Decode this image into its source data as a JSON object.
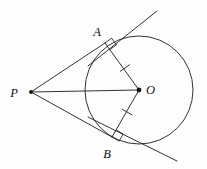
{
  "figure": {
    "background_color": "#fdfdfd",
    "stroke_color": "#1c1c1c",
    "circle_stroke_color": "#333333"
  },
  "labels": {
    "external_point": "P",
    "center": "O",
    "tangent_point_upper": "A",
    "tangent_point_lower": "B"
  },
  "geometry": {
    "circle": {
      "cx": 139,
      "cy": 90,
      "r": 54
    },
    "points": {
      "P": {
        "x": 31,
        "y": 92
      },
      "O": {
        "x": 139,
        "y": 90
      },
      "A": {
        "x": 105,
        "y": 43
      },
      "B": {
        "x": 112,
        "y": 137
      }
    },
    "label_positions": {
      "P": {
        "x": 14,
        "y": 97
      },
      "O": {
        "x": 146,
        "y": 94
      },
      "A": {
        "x": 97,
        "y": 36
      },
      "B": {
        "x": 107,
        "y": 158
      }
    },
    "segments": [
      {
        "name": "PA",
        "from": "P",
        "to": "A"
      },
      {
        "name": "PB",
        "from": "P",
        "to": "B"
      },
      {
        "name": "PO",
        "from": "P",
        "to": "O"
      },
      {
        "name": "OA",
        "from": "O",
        "to": "A"
      },
      {
        "name": "OB",
        "from": "O",
        "to": "B"
      }
    ],
    "tangent_line_upper": {
      "x1": 88,
      "y1": 66,
      "x2": 157,
      "y2": 11
    },
    "tangent_line_lower": {
      "x1": 88,
      "y1": 117,
      "x2": 177,
      "y2": 161
    },
    "tick_marks": [
      {
        "name": "tick-OA",
        "x": 125,
        "y": 68
      },
      {
        "name": "tick-OB",
        "x": 127,
        "y": 112
      }
    ],
    "right_angle_markers": [
      {
        "name": "right-angle-at-A",
        "x": 105,
        "y": 43
      },
      {
        "name": "right-angle-at-B",
        "x": 112,
        "y": 137
      }
    ]
  },
  "chart_data": {
    "type": "diagram",
    "elements": [
      "circle centered at O",
      "tangent line through A",
      "tangent line through B",
      "segment PA",
      "segment PB",
      "segment PO",
      "radius OA",
      "radius OB",
      "right angle at A",
      "right angle at B",
      "congruence tick on OA",
      "congruence tick on OB"
    ]
  }
}
